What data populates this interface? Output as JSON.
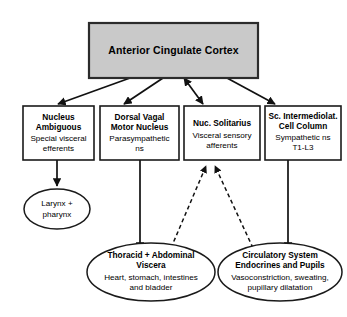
{
  "diagram": {
    "type": "flowchart",
    "colors": {
      "top_box_fill": "#c9c9c9",
      "box_fill": "#ffffff",
      "stroke": "#111111",
      "background": "#ffffff"
    },
    "top_node": {
      "id": "anterior-cingulate-cortex",
      "label": "Anterior Cingulate Cortex"
    },
    "nuclei": [
      {
        "id": "nucleus-ambiguous",
        "head_line1": "Nucleus",
        "head_line2": "Ambiguous",
        "sub_line1": "Special visceral",
        "sub_line2": "efferents",
        "sub_line3": ""
      },
      {
        "id": "dorsal-vagal-motor-nucleus",
        "head_line1": "Dorsal Vagal",
        "head_line2": "Motor Nucleus",
        "sub_line1": "Parasympathetic",
        "sub_line2": "ns",
        "sub_line3": ""
      },
      {
        "id": "nuc-solitarius",
        "head_line1": "Nuc. Solitarius",
        "head_line2": "",
        "sub_line1": "Visceral sensory",
        "sub_line2": "afferents",
        "sub_line3": ""
      },
      {
        "id": "sc-intermediolateral-cell-column",
        "head_line1": "Sc. Intermediolat.",
        "head_line2": "Cell Column",
        "sub_line1": "Sympathetic ns",
        "sub_line2": "T1-L3",
        "sub_line3": ""
      }
    ],
    "targets": [
      {
        "id": "larynx-pharynx",
        "head_line1": "",
        "head_line2": "",
        "plain_line1": "Larynx +",
        "plain_line2": "pharynx"
      },
      {
        "id": "thoracic-abdominal-viscera",
        "head_line1": "Thoracid + Abdominal",
        "head_line2": "Viscera",
        "sub_line1": "Heart, stomach, intestines",
        "sub_line2": "and bladder"
      },
      {
        "id": "circulatory-system-endocrines-pupils",
        "head_line1": "Circulatory System",
        "head_line2": "Endocrines and Pupils",
        "sub_line1": "Vasoconstriction, sweating,",
        "sub_line2": "pupillary dilatation"
      }
    ],
    "edges": [
      {
        "id": "acc-to-nucleus-ambiguous",
        "style": "solid",
        "direction": "down"
      },
      {
        "id": "acc-to-dorsal-vagal",
        "style": "solid",
        "direction": "down"
      },
      {
        "id": "acc-to-nuc-solitarius",
        "style": "solid",
        "direction": "bidirectional"
      },
      {
        "id": "acc-to-sc-intermediolateral",
        "style": "solid",
        "direction": "down"
      },
      {
        "id": "nucleus-ambiguous-to-larynx",
        "style": "solid",
        "direction": "down"
      },
      {
        "id": "dorsal-vagal-to-thoracic",
        "style": "solid",
        "direction": "down"
      },
      {
        "id": "sc-intermediolateral-to-circulatory",
        "style": "solid",
        "direction": "down"
      },
      {
        "id": "thoracic-to-nuc-solitarius",
        "style": "dashed",
        "direction": "up"
      },
      {
        "id": "circulatory-to-nuc-solitarius",
        "style": "dashed",
        "direction": "up"
      }
    ]
  }
}
